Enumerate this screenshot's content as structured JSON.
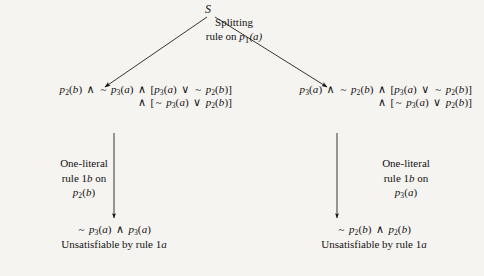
{
  "diagram": {
    "background_color": "#f6f4f1",
    "ink_color": "#121212",
    "root": {
      "label": "S"
    },
    "split_edge": {
      "label_line1": "Splitting",
      "label_line2_prefix": "rule on ",
      "label_line2_symbol": "p",
      "label_line2_subscript": "1",
      "label_line2_arg": "(a)",
      "label_full": "Splitting rule on p1(a)"
    },
    "branches": [
      {
        "side": "left",
        "formula_line1": "p2(b) ∧ ~ p3(a) ∧ [p3(a) ∨ ~ p2(b)]",
        "formula_line2": "∧ [~ p3(a) ∨ p2(b)]",
        "rule_line1": "One-literal",
        "rule_line2": "rule 1b on",
        "rule_line3": "p2(b)",
        "leaf_formula": "~ p3(a) ∧ p3(a)",
        "leaf_note": "Unsatisfiable by rule 1a"
      },
      {
        "side": "right",
        "formula_line1": "p3(a) ∧ ~ p2(b) ∧ [p3(a) ∨ ~ p2(b)]",
        "formula_line2": "∧ [~ p3(a) ∨ p2(b)]",
        "rule_line1": "One-literal",
        "rule_line2": "rule 1b on",
        "rule_line3": "p3(a)",
        "leaf_formula": "~ p2(b) ∧ p2(b)",
        "leaf_note": "Unsatisfiable by rule 1a"
      }
    ],
    "symbols": {
      "and": "∧",
      "or": "∨",
      "not": "~",
      "bracket_open": "[",
      "bracket_close": "]"
    }
  }
}
